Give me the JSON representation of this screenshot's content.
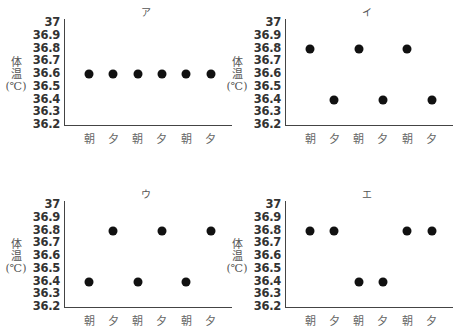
{
  "chart_data": [
    {
      "type": "scatter",
      "title": "ア",
      "xlabel": "",
      "ylabel": "体温(℃)",
      "categories": [
        "朝",
        "夕",
        "朝",
        "夕",
        "朝",
        "夕"
      ],
      "values": [
        36.6,
        36.6,
        36.6,
        36.6,
        36.6,
        36.6
      ],
      "yticks": [
        "37",
        "36.9",
        "36.8",
        "36.7",
        "36.6",
        "36.5",
        "36.4",
        "36.3",
        "36.2"
      ],
      "ylim": [
        36.2,
        37
      ],
      "grid": false
    },
    {
      "type": "scatter",
      "title": "イ",
      "xlabel": "",
      "ylabel": "体温(℃)",
      "categories": [
        "朝",
        "夕",
        "朝",
        "夕",
        "朝",
        "夕"
      ],
      "values": [
        36.8,
        36.4,
        36.8,
        36.4,
        36.8,
        36.4
      ],
      "yticks": [
        "37",
        "36.9",
        "36.8",
        "36.7",
        "36.6",
        "36.5",
        "36.4",
        "36.3",
        "36.2"
      ],
      "ylim": [
        36.2,
        37
      ],
      "grid": false
    },
    {
      "type": "scatter",
      "title": "ウ",
      "xlabel": "",
      "ylabel": "体温(℃)",
      "categories": [
        "朝",
        "夕",
        "朝",
        "夕",
        "朝",
        "夕"
      ],
      "values": [
        36.4,
        36.8,
        36.4,
        36.8,
        36.4,
        36.8
      ],
      "yticks": [
        "37",
        "36.9",
        "36.8",
        "36.7",
        "36.6",
        "36.5",
        "36.4",
        "36.3",
        "36.2"
      ],
      "ylim": [
        36.2,
        37
      ],
      "grid": false
    },
    {
      "type": "scatter",
      "title": "エ",
      "xlabel": "",
      "ylabel": "体温(℃)",
      "categories": [
        "朝",
        "夕",
        "朝",
        "夕",
        "朝",
        "夕"
      ],
      "values": [
        36.8,
        36.8,
        36.4,
        36.4,
        36.8,
        36.8
      ],
      "yticks": [
        "37",
        "36.9",
        "36.8",
        "36.7",
        "36.6",
        "36.5",
        "36.4",
        "36.3",
        "36.2"
      ],
      "ylim": [
        36.2,
        37
      ],
      "grid": false
    }
  ],
  "ylabel_lines": [
    "体",
    "温",
    "(℃)"
  ]
}
